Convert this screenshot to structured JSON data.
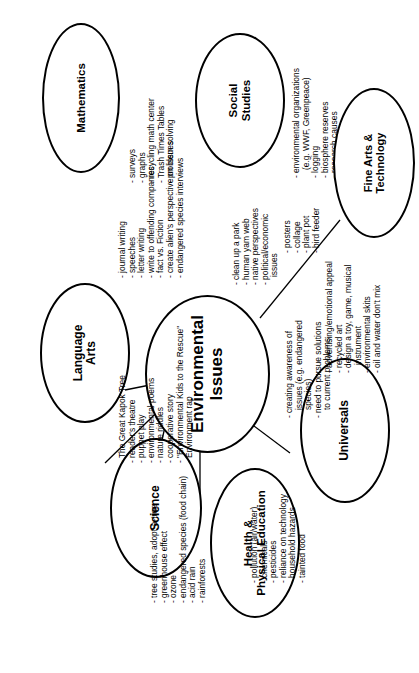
{
  "diagram": {
    "center": {
      "line1": "Environmental",
      "line2": "Issues"
    },
    "nodes": {
      "mathematics": {
        "label1": "Mathematics",
        "label2": "",
        "items": [
          "surveys",
          "graphs",
          "recycling math center",
          "Trash Times Tables",
          "problem solving"
        ]
      },
      "social_studies": {
        "label1": "Social",
        "label2": "Studies",
        "items": [
          "environmental organizations (e.g. WWF, Greenpeace)",
          "logging",
          "biosphere reserves",
          "research causes",
          "plant trees"
        ]
      },
      "fine_arts": {
        "label1": "Fine Arts &",
        "label2": "Technology",
        "items": [
          "posters",
          "collage",
          "plant pot",
          "bird feeder"
        ]
      },
      "language_arts": {
        "label1": "Language",
        "label2": "Arts",
        "items": [
          "journal writing",
          "speeches",
          "letter writing",
          "write to offending companies",
          "fact vs. Fiction",
          "create alien's perspective on issues",
          "endangered species interviews"
        ]
      },
      "science": {
        "label1": "Science",
        "label2": "",
        "items": [
          "The Great Kapok Tree",
          "reader's theatre",
          "puppet play",
          "environmental poems",
          "nature riddles",
          "cooperative story",
          "\"Environmental Kids to the Rescue\"",
          "Environment rap"
        ]
      },
      "health_pe": {
        "label1": "Health &",
        "label2": "Physical Education",
        "items": [
          "tree studies, adopt-a-tree",
          "greenhouse effect",
          "ozone",
          "endangered species (food chain)",
          "acid rain",
          "rainforests"
        ]
      },
      "universals": {
        "label1": "Universals",
        "label2": "",
        "items": [
          "pollution (air/water)",
          "chemicals",
          "pesticides",
          "reliance on technology",
          "household hazards",
          "tainted food"
        ]
      }
    },
    "center_lists": {
      "social_studies_projects": [
        "clean up a park",
        "human yam web",
        "native perspectives",
        "political/economic issues"
      ],
      "universals_awareness": [
        "creating awareness of issues (e.g. endangered species)",
        "need to pursue solutions to current problems"
      ],
      "fine_arts_projects": [
        "advertising/emotional appeal",
        "recycled art",
        "design a toy, game, musical instrument",
        "environmental skits",
        "oil and water don't mix"
      ]
    }
  }
}
